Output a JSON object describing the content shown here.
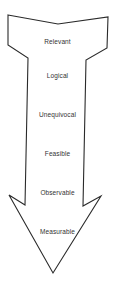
{
  "diagram": {
    "type": "downward-arrow",
    "stroke_color": "#2a2a2a",
    "fill_color": "#ffffff",
    "labels": [
      {
        "text": "Relevant",
        "y": 38
      },
      {
        "text": "Logical",
        "y": 72
      },
      {
        "text": "Unequivocal",
        "y": 111
      },
      {
        "text": "Feasible",
        "y": 150
      },
      {
        "text": "Observable",
        "y": 189
      },
      {
        "text": "Measurable",
        "y": 228
      }
    ]
  }
}
